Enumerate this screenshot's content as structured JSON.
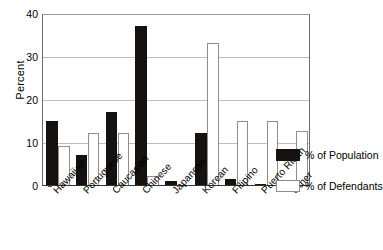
{
  "chart_data": {
    "type": "bar",
    "title": "",
    "xlabel": "",
    "ylabel": "Percent",
    "ylim": [
      0,
      40
    ],
    "yticks": [
      0,
      10,
      20,
      30,
      40
    ],
    "ytick_labels": [
      "0",
      "10",
      "20",
      "30",
      "40"
    ],
    "grid": true,
    "legend_position": "right",
    "categories": [
      "Hawaiian",
      "Portuguese",
      "Caucasian",
      "Chinese",
      "Japanese",
      "Korean",
      "Filipino",
      "Puerto Rican",
      "Other"
    ],
    "series": [
      {
        "name": "% of Population",
        "color": "#151210",
        "values": [
          15,
          7,
          17,
          37,
          1,
          12,
          1.5,
          0.3,
          0
        ]
      },
      {
        "name": "% of Defendants",
        "color": "#ffffff",
        "values": [
          9,
          12,
          12,
          2,
          0,
          33,
          15,
          15,
          12.5
        ]
      }
    ]
  },
  "legend": {
    "items": [
      {
        "label": "% of Population"
      },
      {
        "label": "% of Defendants"
      }
    ]
  },
  "axis": {
    "y_title": "Percent"
  }
}
